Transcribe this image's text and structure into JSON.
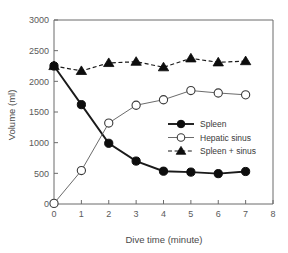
{
  "chart_data": {
    "type": "line",
    "title": "",
    "xlabel": "Dive time (minute)",
    "ylabel": "Volume (ml)",
    "xlim": [
      0,
      8
    ],
    "ylim": [
      0,
      3000
    ],
    "xticks": [
      0,
      1,
      2,
      3,
      4,
      5,
      6,
      7,
      8
    ],
    "xtick_labels": [
      "0",
      "1",
      "2",
      "3",
      "4",
      "5",
      "6",
      "7",
      "8"
    ],
    "yticks": [
      0,
      500,
      1000,
      1500,
      2000,
      2500,
      3000
    ],
    "ytick_labels": [
      "0",
      "500",
      "1000",
      "1500",
      "2000",
      "2500",
      "3000"
    ],
    "grid": false,
    "legend_position": "center-right",
    "x": [
      0,
      1,
      2,
      3,
      4,
      5,
      6,
      7
    ],
    "series": [
      {
        "name": "Spleen",
        "marker": "filled-circle",
        "linestyle": "solid",
        "color": "#0d0d0d",
        "values": [
          2250,
          1620,
          990,
          700,
          535,
          520,
          495,
          530
        ]
      },
      {
        "name": "Hepatic sinus",
        "marker": "open-circle",
        "linestyle": "thin",
        "color": "#5a5a5a",
        "values": [
          10,
          545,
          1320,
          1610,
          1700,
          1850,
          1810,
          1780
        ]
      },
      {
        "name": "Spleen + sinus",
        "marker": "triangle",
        "linestyle": "dashed",
        "color": "#0d0d0d",
        "values": [
          2250,
          2170,
          2300,
          2320,
          2230,
          2375,
          2310,
          2330
        ]
      }
    ]
  },
  "legend": {
    "items": [
      {
        "label": "Spleen"
      },
      {
        "label": "Hepatic sinus"
      },
      {
        "label": "Spleen + sinus"
      }
    ]
  }
}
